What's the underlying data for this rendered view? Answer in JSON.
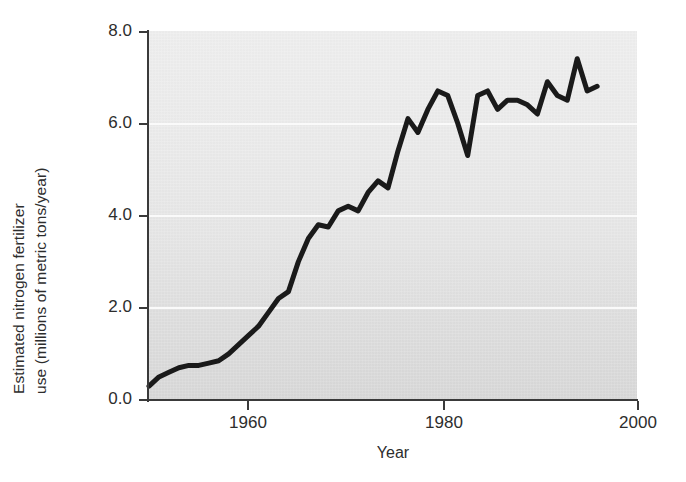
{
  "chart_data": {
    "type": "line",
    "title": "",
    "xlabel": "Year",
    "ylabel": "Estimated nitrogen fertilizer use (millions of metric tons/year)",
    "ylabel_line1": "Estimated nitrogen fertilizer",
    "ylabel_line2": "use (millions of metric tons/year)",
    "xlim": [
      1951,
      2000
    ],
    "ylim": [
      0.0,
      8.0
    ],
    "xticks": [
      1960,
      1980,
      2000
    ],
    "xtick_labels": [
      "1960",
      "1980",
      "2000"
    ],
    "yticks": [
      0.0,
      2.0,
      4.0,
      6.0,
      8.0
    ],
    "ytick_labels": [
      "0.0",
      "2.0",
      "4.0",
      "6.0",
      "8.0"
    ],
    "gridlines_y": [
      2.0,
      4.0,
      6.0
    ],
    "grid": true,
    "grid_color": "#fafafa",
    "plot_background": "#e8e8e8",
    "line_color": "#1a1a1a",
    "line_width": 5,
    "legend": "none",
    "series": [
      {
        "name": "Estimated nitrogen fertilizer use",
        "x": [
          1951,
          1952,
          1953,
          1954,
          1955,
          1956,
          1957,
          1958,
          1959,
          1960,
          1961,
          1962,
          1963,
          1964,
          1965,
          1966,
          1967,
          1968,
          1969,
          1970,
          1971,
          1972,
          1973,
          1974,
          1975,
          1976,
          1977,
          1978,
          1979,
          1980,
          1981,
          1982,
          1983,
          1984,
          1985,
          1986,
          1987,
          1988,
          1989,
          1990,
          1991,
          1992,
          1993,
          1994,
          1995,
          1996
        ],
        "values": [
          0.3,
          0.5,
          0.6,
          0.7,
          0.75,
          0.75,
          0.8,
          0.85,
          1.0,
          1.2,
          1.4,
          1.6,
          1.9,
          2.2,
          2.35,
          3.0,
          3.5,
          3.8,
          3.75,
          4.1,
          4.2,
          4.1,
          4.5,
          4.75,
          4.6,
          5.4,
          6.1,
          5.8,
          6.3,
          6.7,
          6.6,
          6.0,
          5.3,
          6.6,
          6.7,
          6.3,
          6.5,
          6.5,
          6.4,
          6.2,
          6.9,
          6.6,
          6.5,
          7.4,
          6.7,
          6.8
        ]
      }
    ]
  }
}
